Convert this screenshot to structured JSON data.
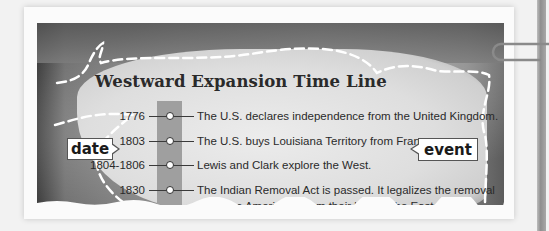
{
  "title": "Westward Expansion Time Line",
  "callouts": {
    "date_label": "date",
    "event_label": "event"
  },
  "timeline": [
    {
      "date": "1776",
      "event": "The U.S. declares independence from the United Kingdom."
    },
    {
      "date": "1803",
      "event": "The U.S. buys Louisiana Territory from France."
    },
    {
      "date": "1804-1806",
      "event": "Lewis and Clark explore the West."
    },
    {
      "date": "1830",
      "event": "The Indian Removal Act is passed. It legalizes the removal",
      "event_line2": "of Native Americans from their land in the East."
    }
  ],
  "colors": {
    "timeline_bar": "#9f9f9f",
    "text": "#2a2a2a"
  }
}
